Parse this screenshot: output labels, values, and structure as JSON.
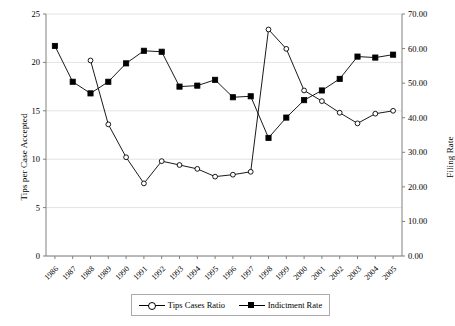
{
  "chart_data": {
    "type": "line",
    "title": "",
    "xlabel": "",
    "ylabel": "Tips per Case Accepted",
    "y2label": "Filing Rate",
    "grid": true,
    "legend_position": "bottom",
    "ylim": [
      0,
      25
    ],
    "y2lim": [
      0.0,
      70.0
    ],
    "yticks": [
      "0",
      "5",
      "10",
      "15",
      "20",
      "25"
    ],
    "y2ticks": [
      "0.00",
      "10.00",
      "20.00",
      "30.00",
      "40.00",
      "50.00",
      "60.00",
      "70.00"
    ],
    "categories": [
      "1986",
      "1987",
      "1988",
      "1989",
      "1990",
      "1991",
      "1992",
      "1993",
      "1994",
      "1995",
      "1996",
      "1997",
      "1998",
      "1999",
      "2000",
      "2001",
      "2002",
      "2003",
      "2004",
      "2005"
    ],
    "series": [
      {
        "name": "Tips Cases Ratio",
        "axis": "left",
        "marker": "open-circle",
        "values": [
          null,
          null,
          20.2,
          13.6,
          10.2,
          7.5,
          9.8,
          9.4,
          9.0,
          8.2,
          8.4,
          8.7,
          23.4,
          21.4,
          17.1,
          16.0,
          14.8,
          13.7,
          14.7,
          15.0
        ]
      },
      {
        "name": "Indictment Rate",
        "axis": "right",
        "marker": "filled-square",
        "values_left_scale": [
          21.7,
          18.0,
          16.8,
          18.0,
          19.9,
          21.2,
          21.1,
          17.5,
          17.6,
          18.2,
          16.4,
          16.5,
          12.2,
          14.3,
          16.1,
          17.1,
          18.3,
          20.6,
          20.5,
          20.8
        ],
        "values": [
          60.8,
          50.4,
          47.0,
          50.4,
          55.7,
          59.4,
          59.1,
          49.0,
          49.3,
          51.0,
          45.9,
          46.2,
          34.2,
          40.0,
          45.1,
          47.9,
          51.2,
          57.7,
          57.4,
          58.2
        ]
      }
    ]
  },
  "legend": {
    "entries": [
      {
        "label": "Tips Cases Ratio"
      },
      {
        "label": "Indictment Rate"
      }
    ]
  }
}
